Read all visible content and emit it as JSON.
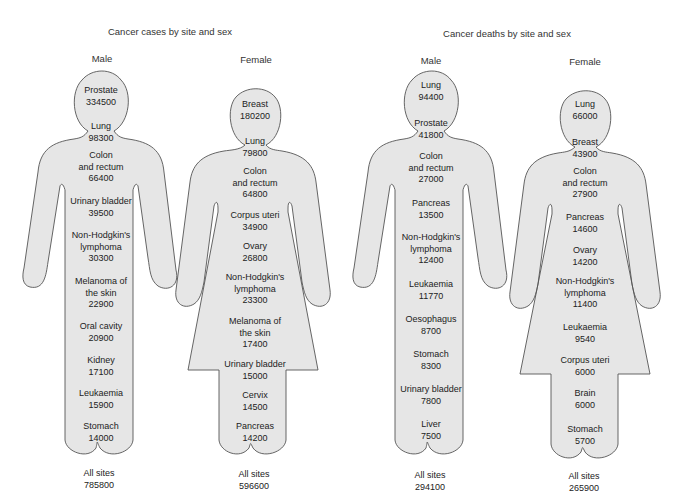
{
  "titles": {
    "cases": "Cancer cases by site and sex",
    "deaths": "Cancer deaths by site and sex"
  },
  "panels": {
    "cases_male": {
      "sex": "Male",
      "sites": [
        {
          "line1": "Prostate",
          "line2": "",
          "value": "334500"
        },
        {
          "line1": "Lung",
          "line2": "",
          "value": "98300"
        },
        {
          "line1": "Colon",
          "line2": "and rectum",
          "value": "66400"
        },
        {
          "line1": "Urinary bladder",
          "line2": "",
          "value": "39500"
        },
        {
          "line1": "Non-Hodgkin's",
          "line2": "lymphoma",
          "value": "30300"
        },
        {
          "line1": "Melanoma of",
          "line2": "the skin",
          "value": "22900"
        },
        {
          "line1": "Oral cavity",
          "line2": "",
          "value": "20900"
        },
        {
          "line1": "Kidney",
          "line2": "",
          "value": "17100"
        },
        {
          "line1": "Leukaemia",
          "line2": "",
          "value": "15900"
        },
        {
          "line1": "Stomach",
          "line2": "",
          "value": "14000"
        }
      ],
      "total_label": "All sites",
      "total_value": "785800"
    },
    "cases_female": {
      "sex": "Female",
      "sites": [
        {
          "line1": "Breast",
          "line2": "",
          "value": "180200"
        },
        {
          "line1": "Lung",
          "line2": "",
          "value": "79800"
        },
        {
          "line1": "Colon",
          "line2": "and rectum",
          "value": "64800"
        },
        {
          "line1": "Corpus uteri",
          "line2": "",
          "value": "34900"
        },
        {
          "line1": "Ovary",
          "line2": "",
          "value": "26800"
        },
        {
          "line1": "Non-Hodgkin's",
          "line2": "lymphoma",
          "value": "23300"
        },
        {
          "line1": "Melanoma of",
          "line2": "the skin",
          "value": "17400"
        },
        {
          "line1": "Urinary bladder",
          "line2": "",
          "value": "15000"
        },
        {
          "line1": "Cervix",
          "line2": "",
          "value": "14500"
        },
        {
          "line1": "Pancreas",
          "line2": "",
          "value": "14200"
        }
      ],
      "total_label": "All sites",
      "total_value": "596600"
    },
    "deaths_male": {
      "sex": "Male",
      "sites": [
        {
          "line1": "Lung",
          "line2": "",
          "value": "94400"
        },
        {
          "line1": "Prostate",
          "line2": "",
          "value": "41800"
        },
        {
          "line1": "Colon",
          "line2": "and rectum",
          "value": "27000"
        },
        {
          "line1": "Pancreas",
          "line2": "",
          "value": "13500"
        },
        {
          "line1": "Non-Hodgkin's",
          "line2": "lymphoma",
          "value": "12400"
        },
        {
          "line1": "Leukaemia",
          "line2": "",
          "value": "11770"
        },
        {
          "line1": "Oesophagus",
          "line2": "",
          "value": "8700"
        },
        {
          "line1": "Stomach",
          "line2": "",
          "value": "8300"
        },
        {
          "line1": "Urinary bladder",
          "line2": "",
          "value": "7800"
        },
        {
          "line1": "Liver",
          "line2": "",
          "value": "7500"
        }
      ],
      "total_label": "All sites",
      "total_value": "294100"
    },
    "deaths_female": {
      "sex": "Female",
      "sites": [
        {
          "line1": "Lung",
          "line2": "",
          "value": "66000"
        },
        {
          "line1": "Breast",
          "line2": "",
          "value": "43900"
        },
        {
          "line1": "Colon",
          "line2": "and rectum",
          "value": "27900"
        },
        {
          "line1": "Pancreas",
          "line2": "",
          "value": "14600"
        },
        {
          "line1": "Ovary",
          "line2": "",
          "value": "14200"
        },
        {
          "line1": "Non-Hodgkin's",
          "line2": "lymphoma",
          "value": "11400"
        },
        {
          "line1": "Leukaemia",
          "line2": "",
          "value": "9540"
        },
        {
          "line1": "Corpus uteri",
          "line2": "",
          "value": "6000"
        },
        {
          "line1": "Brain",
          "line2": "",
          "value": "6000"
        },
        {
          "line1": "Stomach",
          "line2": "",
          "value": "5700"
        }
      ],
      "total_label": "All sites",
      "total_value": "265900"
    }
  },
  "colors": {
    "figure_fill": "#e6e6e6",
    "figure_stroke": "#555555",
    "text": "#222222"
  }
}
